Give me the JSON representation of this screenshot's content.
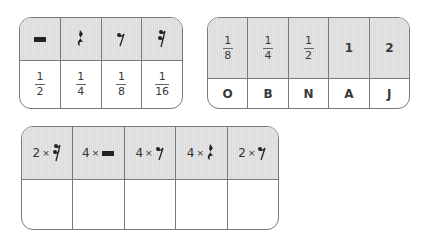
{
  "table_rests": {
    "headers": [
      {
        "icon": "half-rest-icon"
      },
      {
        "icon": "quarter-rest-icon"
      },
      {
        "icon": "eighth-rest-icon"
      },
      {
        "icon": "sixteenth-rest-icon"
      }
    ],
    "values": [
      {
        "numerator": "1",
        "denominator": "2"
      },
      {
        "numerator": "1",
        "denominator": "4"
      },
      {
        "numerator": "1",
        "denominator": "8"
      },
      {
        "numerator": "1",
        "denominator": "16"
      }
    ]
  },
  "table_code": {
    "headers": [
      {
        "type": "fraction",
        "numerator": "1",
        "denominator": "8"
      },
      {
        "type": "fraction",
        "numerator": "1",
        "denominator": "4"
      },
      {
        "type": "fraction",
        "numerator": "1",
        "denominator": "2"
      },
      {
        "type": "number",
        "value": "1"
      },
      {
        "type": "number",
        "value": "2"
      }
    ],
    "letters": [
      "O",
      "B",
      "N",
      "A",
      "J"
    ]
  },
  "table_puzzle": {
    "headers": [
      {
        "count": "2",
        "times": "×",
        "icon": "sixteenth-rest-icon"
      },
      {
        "count": "4",
        "times": "×",
        "icon": "half-rest-icon"
      },
      {
        "count": "4",
        "times": "×",
        "icon": "eighth-rest-icon"
      },
      {
        "count": "4",
        "times": "×",
        "icon": "quarter-rest-icon"
      },
      {
        "count": "2",
        "times": "×",
        "icon": "eighth-rest-icon"
      }
    ],
    "answers": [
      "",
      "",
      "",
      "",
      ""
    ]
  }
}
